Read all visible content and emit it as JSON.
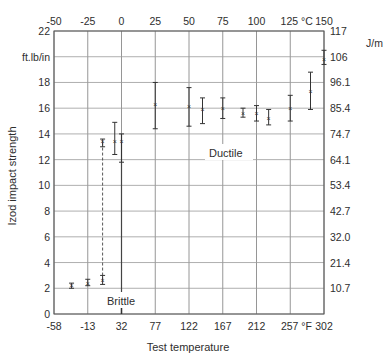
{
  "chart_data": {
    "type": "scatter",
    "title": "",
    "xlabel": "Test temperature",
    "ylabel": "Izod impact strength",
    "y_unit_left": "ft.lb/in",
    "y_unit_right": "J/m",
    "x_unit_top": "°C",
    "x_unit_bottom": "°F",
    "x_ticks_top_c": [
      "-50",
      "-25",
      "0",
      "25",
      "50",
      "75",
      "100",
      "125 °C",
      "150"
    ],
    "x_ticks_bottom_f": [
      "-58",
      "-13",
      "32",
      "77",
      "122",
      "167",
      "212",
      "257 °F",
      "302"
    ],
    "y_ticks_left": [
      "0",
      "2",
      "4",
      "6",
      "8",
      "10",
      "12",
      "14",
      "16",
      "18",
      "ft.lb/in",
      "22"
    ],
    "y_ticks_right": [
      "10.7",
      "21.4",
      "32.0",
      "42.7",
      "53.4",
      "64.1",
      "74.7",
      "85.4",
      "96.1",
      "106",
      "117"
    ],
    "xlim_c": [
      -50,
      150
    ],
    "ylim": [
      0,
      22
    ],
    "grid": true,
    "annotations": [
      {
        "text": "Brittle",
        "x_c": 0,
        "y": 1.0
      },
      {
        "text": "Ductile",
        "x_c": 85,
        "y": 12.0
      }
    ],
    "points": [
      {
        "x_c": -37,
        "y": 2.2,
        "low": 2.0,
        "high": 2.4
      },
      {
        "x_c": -25,
        "y": 2.4,
        "low": 2.2,
        "high": 2.7
      },
      {
        "x_c": -14,
        "y": 2.6,
        "low": 2.3,
        "high": 3.0
      },
      {
        "x_c": -14,
        "y": 13.4,
        "low": 13.0,
        "high": 13.6
      },
      {
        "x_c": -5,
        "y": 13.4,
        "low": 12.4,
        "high": 14.9
      },
      {
        "x_c": 0,
        "y": 13.4,
        "low": 11.8,
        "high": 14.0
      },
      {
        "x_c": 25,
        "y": 16.3,
        "low": 14.4,
        "high": 18.0
      },
      {
        "x_c": 50,
        "y": 16.1,
        "low": 14.6,
        "high": 17.6
      },
      {
        "x_c": 60,
        "y": 15.9,
        "low": 14.8,
        "high": 16.8
      },
      {
        "x_c": 75,
        "y": 16.0,
        "low": 15.2,
        "high": 16.8
      },
      {
        "x_c": 90,
        "y": 15.6,
        "low": 15.3,
        "high": 16.0
      },
      {
        "x_c": 100,
        "y": 15.6,
        "low": 15.0,
        "high": 16.2
      },
      {
        "x_c": 109,
        "y": 15.2,
        "low": 14.7,
        "high": 15.9
      },
      {
        "x_c": 125,
        "y": 16.0,
        "low": 15.0,
        "high": 17.0
      },
      {
        "x_c": 140,
        "y": 17.3,
        "low": 15.9,
        "high": 18.8
      },
      {
        "x_c": 150,
        "y": 19.8,
        "low": 19.4,
        "high": 20.5
      }
    ],
    "transition_lines": [
      {
        "x_c": -14,
        "from": 2.6,
        "to": 13.4,
        "style": "dashed"
      },
      {
        "x_c": 0,
        "from": 0,
        "to": 14.0,
        "style": "solid"
      }
    ]
  }
}
